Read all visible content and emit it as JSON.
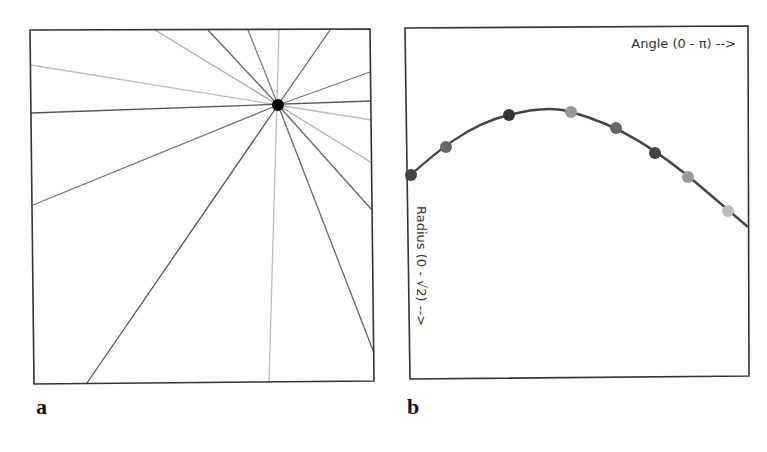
{
  "panels": {
    "a": {
      "label": "a",
      "description": "Lines through a single point (Hough space illustration)",
      "point": {
        "x": 278,
        "y": 105,
        "color": "#000000"
      },
      "lines": [
        {
          "x1": 155,
          "y1": 30,
          "x2": 278,
          "y2": 105,
          "color": "#aaaaaa"
        },
        {
          "x1": 208,
          "y1": 30,
          "x2": 278,
          "y2": 105,
          "color": "#666666"
        },
        {
          "x1": 248,
          "y1": 30,
          "x2": 278,
          "y2": 105,
          "color": "#777777"
        },
        {
          "x1": 279,
          "y1": 30,
          "x2": 269,
          "y2": 382,
          "color": "#bbbbbb"
        },
        {
          "x1": 330,
          "y1": 30,
          "x2": 278,
          "y2": 105,
          "color": "#666666"
        },
        {
          "x1": 31,
          "y1": 65,
          "x2": 278,
          "y2": 105,
          "color": "#bbbbbb"
        },
        {
          "x1": 31,
          "y1": 113,
          "x2": 371,
          "y2": 101,
          "color": "#555555"
        },
        {
          "x1": 33,
          "y1": 205,
          "x2": 278,
          "y2": 105,
          "color": "#777777"
        },
        {
          "x1": 87,
          "y1": 383,
          "x2": 278,
          "y2": 105,
          "color": "#555555"
        },
        {
          "x1": 370,
          "y1": 72,
          "x2": 278,
          "y2": 105,
          "color": "#777777"
        },
        {
          "x1": 371,
          "y1": 120,
          "x2": 278,
          "y2": 105,
          "color": "#bbbbbb"
        },
        {
          "x1": 372,
          "y1": 163,
          "x2": 278,
          "y2": 105,
          "color": "#aaaaaa"
        },
        {
          "x1": 372,
          "y1": 210,
          "x2": 278,
          "y2": 105,
          "color": "#666666"
        },
        {
          "x1": 374,
          "y1": 353,
          "x2": 278,
          "y2": 105,
          "color": "#666666"
        }
      ]
    },
    "b": {
      "label": "b",
      "x_axis_label": "Angle (0 - π) -->",
      "y_axis_label": "Radius (0 - √2) -->",
      "curve_color": "#444444",
      "dots": [
        {
          "x": 411,
          "y": 175,
          "color": "#444444"
        },
        {
          "x": 446,
          "y": 147,
          "color": "#666666"
        },
        {
          "x": 509,
          "y": 115,
          "color": "#333333"
        },
        {
          "x": 571,
          "y": 112,
          "color": "#999999"
        },
        {
          "x": 616,
          "y": 128,
          "color": "#666666"
        },
        {
          "x": 655,
          "y": 153,
          "color": "#444444"
        },
        {
          "x": 688,
          "y": 177,
          "color": "#999999"
        },
        {
          "x": 728,
          "y": 211,
          "color": "#bbbbbb"
        }
      ]
    }
  },
  "chart_data": {
    "type": "line",
    "xlabel": "Angle (0 - π)",
    "ylabel": "Radius (0 - √2)",
    "x": [
      0.0,
      0.11,
      0.29,
      0.48,
      0.61,
      0.73,
      0.83,
      0.94
    ],
    "values": [
      0.73,
      0.81,
      0.9,
      0.91,
      0.87,
      0.8,
      0.73,
      0.64
    ],
    "grid": false
  }
}
